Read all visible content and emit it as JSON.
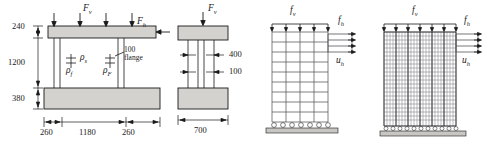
{
  "diagram": {
    "figures": [
      {
        "id": "fig-elevation",
        "name": "elevation-view",
        "loads": [
          {
            "name": "vertical-load",
            "symbol": "F",
            "subscript": "v"
          },
          {
            "name": "horizontal-load",
            "symbol": "F",
            "subscript": "h"
          }
        ],
        "vertical_dimensions": [
          "240",
          "1200",
          "380"
        ],
        "horizontal_dimensions": [
          "260",
          "1180",
          "260"
        ],
        "reinforcement_labels": [
          {
            "symbol": "ρ",
            "subscript": "s"
          },
          {
            "symbol": "ρ",
            "subscript": "f"
          },
          {
            "symbol": "ρ",
            "subscript": "F"
          }
        ],
        "annotation": {
          "value": "100",
          "text": "flange"
        }
      },
      {
        "id": "fig-section",
        "name": "section-view",
        "loads": [
          {
            "name": "vertical-load",
            "symbol": "F",
            "subscript": "v"
          }
        ],
        "inner_dimensions": [
          "400",
          "100"
        ],
        "base_dimension": "700"
      },
      {
        "id": "fig-mesh-coarse",
        "name": "coarse-mesh-model",
        "loads": [
          {
            "name": "distributed-vertical-load",
            "symbol": "f",
            "subscript": "v"
          },
          {
            "name": "horizontal-load",
            "symbol": "f",
            "subscript": "h"
          }
        ],
        "displacement": {
          "symbol": "u",
          "subscript": "h"
        },
        "mesh": {
          "columns": 4,
          "rows": 9
        },
        "support": "fixed-roller-base"
      },
      {
        "id": "fig-mesh-fine",
        "name": "fine-mesh-model",
        "loads": [
          {
            "name": "distributed-vertical-load",
            "symbol": "f",
            "subscript": "v"
          },
          {
            "name": "horizontal-load",
            "symbol": "f",
            "subscript": "h"
          }
        ],
        "displacement": {
          "symbol": "u",
          "subscript": "h"
        },
        "mesh": {
          "columns": 24,
          "rows": 22,
          "major_columns": 6
        },
        "support": "fixed-roller-base"
      }
    ],
    "colors": {
      "line": "#1a1a1a",
      "concrete_fill": "#d4d2ce",
      "mesh_line": "#55555a",
      "mesh_major": "#2a2a2e",
      "ground": "#c8c6c2"
    }
  }
}
